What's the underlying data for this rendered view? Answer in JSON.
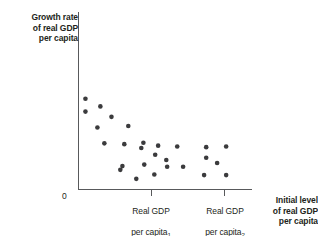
{
  "figure": {
    "background": "#ffffff",
    "axis_color": "#58595b",
    "dot_color": "#3b3b3d",
    "text_color": "#231f20"
  },
  "labels": {
    "y_axis_title": "Growth rate\nof real GDP\nper capita",
    "origin": "0",
    "tick_1_line1": "Real GDP",
    "tick_1_line2": "per capita",
    "tick_1_subscript": "1",
    "tick_2_line1": "Real GDP",
    "tick_2_line2": "per capita",
    "tick_2_subscript": "2",
    "x_axis_title": "Initial level\nof real GDP\nper capita"
  },
  "chart_data": {
    "type": "scatter",
    "title": "",
    "xlabel": "Initial level of real GDP per capita",
    "ylabel": "Growth rate of real GDP per capita",
    "grid": false,
    "legend": false,
    "xlim": [
      0,
      1
    ],
    "ylim": [
      0,
      1
    ],
    "xticks": [
      {
        "value": 0.0,
        "label": "0"
      },
      {
        "value": 0.42,
        "label": "Real GDP per capita₁"
      },
      {
        "value": 0.84,
        "label": "Real GDP per capita₂"
      }
    ],
    "yticks": [],
    "points": [
      {
        "x": 0.04,
        "y": 0.675
      },
      {
        "x": 0.126,
        "y": 0.618
      },
      {
        "x": 0.04,
        "y": 0.579
      },
      {
        "x": 0.19,
        "y": 0.54
      },
      {
        "x": 0.109,
        "y": 0.461
      },
      {
        "x": 0.287,
        "y": 0.472
      },
      {
        "x": 0.374,
        "y": 0.348
      },
      {
        "x": 0.149,
        "y": 0.343
      },
      {
        "x": 0.264,
        "y": 0.337
      },
      {
        "x": 0.362,
        "y": 0.309
      },
      {
        "x": 0.459,
        "y": 0.326
      },
      {
        "x": 0.569,
        "y": 0.32
      },
      {
        "x": 0.736,
        "y": 0.315
      },
      {
        "x": 0.851,
        "y": 0.32
      },
      {
        "x": 0.442,
        "y": 0.258
      },
      {
        "x": 0.736,
        "y": 0.236
      },
      {
        "x": 0.506,
        "y": 0.219
      },
      {
        "x": 0.799,
        "y": 0.197
      },
      {
        "x": 0.379,
        "y": 0.185
      },
      {
        "x": 0.253,
        "y": 0.174
      },
      {
        "x": 0.511,
        "y": 0.169
      },
      {
        "x": 0.603,
        "y": 0.169
      },
      {
        "x": 0.241,
        "y": 0.146
      },
      {
        "x": 0.437,
        "y": 0.112
      },
      {
        "x": 0.724,
        "y": 0.107
      },
      {
        "x": 0.851,
        "y": 0.107
      },
      {
        "x": 0.333,
        "y": 0.079
      }
    ]
  }
}
